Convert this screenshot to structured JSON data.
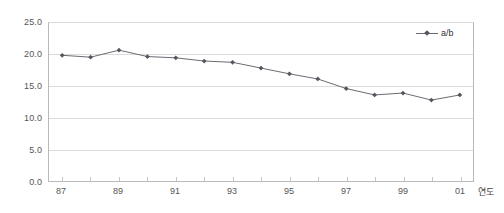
{
  "chart_data": {
    "type": "line",
    "title": "",
    "xlabel": "연도",
    "ylabel": "",
    "x": [
      1987,
      1988,
      1989,
      1990,
      1991,
      1992,
      1993,
      1994,
      1995,
      1996,
      1997,
      1998,
      1999,
      2000,
      2001
    ],
    "categories": [
      "87",
      "88",
      "89",
      "90",
      "91",
      "92",
      "93",
      "94",
      "95",
      "96",
      "97",
      "98",
      "99",
      "00",
      "01"
    ],
    "series": [
      {
        "name": "a/b",
        "values": [
          19.8,
          19.5,
          20.6,
          19.6,
          19.4,
          18.9,
          18.7,
          17.8,
          16.9,
          16.1,
          14.6,
          13.6,
          13.9,
          12.8,
          13.6
        ]
      }
    ],
    "xtick_labels": [
      "87",
      "89",
      "91",
      "93",
      "95",
      "97",
      "99",
      "01"
    ],
    "xtick_values": [
      1987,
      1989,
      1991,
      1993,
      1995,
      1997,
      1999,
      2001
    ],
    "ytick_labels": [
      "0.0",
      "5.0",
      "10.0",
      "15.0",
      "20.0",
      "25.0"
    ],
    "ytick_values": [
      0.0,
      5.0,
      10.0,
      15.0,
      20.0,
      25.0
    ],
    "ylim": [
      0.0,
      25.0
    ],
    "xlim": [
      1986.5,
      2001.5
    ],
    "grid": true,
    "grid_axis": "y",
    "legend_position": "top-right",
    "legend_entries": [
      "a/b"
    ],
    "colors": {
      "series_line": "#6b6b73",
      "series_marker": "#55555d",
      "gridline": "#dcdcdc",
      "axis": "#b9b9b9",
      "tick_text": "#555555"
    }
  }
}
